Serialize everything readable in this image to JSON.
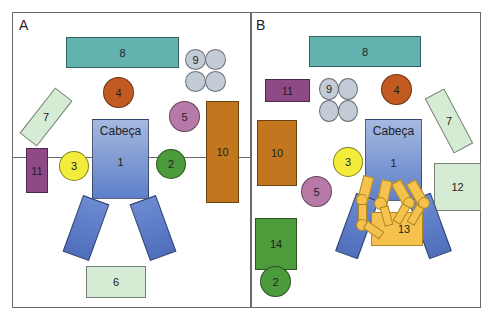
{
  "figure": {
    "panels": [
      {
        "label": "A",
        "shapes": {
          "head": {
            "label": "Cabeça",
            "number": "1"
          },
          "s2": "2",
          "s3": "3",
          "s4": "4",
          "s5": "5",
          "s6": "6",
          "s7": "7",
          "s8": "8",
          "s9": "9",
          "s10": "10",
          "s11": "11"
        }
      },
      {
        "label": "B",
        "shapes": {
          "head": {
            "label": "Cabeça",
            "number": "1"
          },
          "s2": "2",
          "s3": "3",
          "s4": "4",
          "s5": "5",
          "s7": "7",
          "s8": "8",
          "s9": "9",
          "s10": "10",
          "s11": "11",
          "s12": "12",
          "s13": "13",
          "s14": "14"
        }
      }
    ],
    "colors": {
      "teal": "#62b3b0",
      "mint": "#d6ebd3",
      "orange": "#c35a22",
      "brown": "#c2771f",
      "purple": "#8e4a86",
      "pink": "#b77aa8",
      "yellow": "#f3ec3a",
      "green": "#4b9a3b",
      "grey": "#c3cbd6",
      "blue": "#5e7fc8",
      "gold": "#f4c24d"
    }
  }
}
